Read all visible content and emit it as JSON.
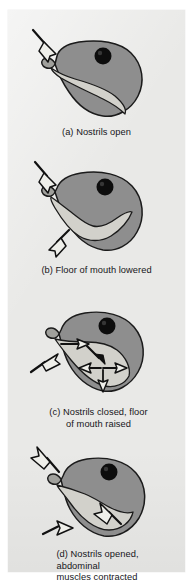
{
  "figure": {
    "background_color": "#e9e9e7",
    "page_background": "#ffffff"
  },
  "palette": {
    "body_gray": "#8e8e8e",
    "cavity_light": "#d2d1cb",
    "outline": "#1b1b1b",
    "eye": "#0d0d0d",
    "arrow_fill": "#efefea",
    "arrow_outline": "#111111",
    "text": "#16161a"
  },
  "panels": [
    {
      "id": "a",
      "label": "(a)",
      "caption_lines": [
        "(a) Nostrils open"
      ],
      "caption_full": "(a) Nostrils open",
      "arrows": [
        {
          "name": "nostril-inflow-arrow",
          "style": "hollow",
          "direction": "down-right",
          "target": "nostril"
        }
      ],
      "arrow_count": 1
    },
    {
      "id": "b",
      "label": "(b)",
      "caption_lines": [
        "(b) Floor of mouth lowered"
      ],
      "caption_full": "(b) Floor of mouth lowered",
      "arrows": [
        {
          "name": "nostril-inflow-arrow",
          "style": "hollow",
          "direction": "down-right",
          "target": "nostril"
        },
        {
          "name": "mouth-floor-lowering-arrow",
          "style": "hollow",
          "direction": "down-left",
          "target": "mouth-floor"
        }
      ],
      "arrow_count": 2
    },
    {
      "id": "c",
      "label": "(c)",
      "caption_lines": [
        "(c) Nostrils closed, floor",
        "of mouth raised"
      ],
      "caption_full": "(c) Nostrils closed, floor of mouth raised",
      "arrows": [
        {
          "name": "external-inflow-arrow",
          "style": "hollow",
          "direction": "up-right",
          "target": "mouth"
        },
        {
          "name": "airflow-arrow-1",
          "style": "hollow",
          "direction": "right",
          "target": "buccal-cavity"
        },
        {
          "name": "airflow-arrow-2",
          "style": "solid",
          "direction": "down-right",
          "target": "buccal-cavity"
        },
        {
          "name": "airflow-arrow-3",
          "style": "hollow",
          "direction": "left",
          "target": "lung-cavity"
        },
        {
          "name": "airflow-arrow-4",
          "style": "hollow",
          "direction": "right",
          "target": "lung-cavity"
        },
        {
          "name": "airflow-arrow-5",
          "style": "hollow",
          "direction": "down",
          "target": "lung-cavity"
        }
      ],
      "arrow_count": 6
    },
    {
      "id": "d",
      "label": "(d)",
      "caption_lines": [
        "(d) Nostrils opened,",
        "abdominal",
        "muscles contracted"
      ],
      "caption_full": "(d) Nostrils opened, abdominal muscles contracted",
      "arrows": [
        {
          "name": "nostril-outflow-arrow",
          "style": "hollow",
          "direction": "up-left",
          "target": "nostril"
        },
        {
          "name": "lung-exhale-arrow",
          "style": "hollow",
          "direction": "up-left",
          "target": "lung-cavity"
        },
        {
          "name": "abdominal-contraction-arrow",
          "style": "hollow",
          "direction": "up-right",
          "target": "abdomen"
        }
      ],
      "arrow_count": 3
    }
  ]
}
